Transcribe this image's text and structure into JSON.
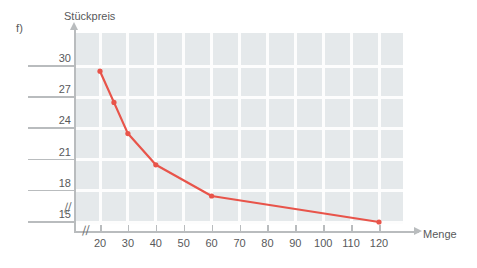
{
  "exercise": {
    "label": "f)"
  },
  "chart_data": {
    "type": "line",
    "title": "",
    "xlabel": "Menge",
    "ylabel": "Stückpreis",
    "xticks": [
      20,
      30,
      40,
      50,
      60,
      70,
      80,
      90,
      100,
      110,
      120
    ],
    "yticks": [
      30,
      27,
      24,
      21,
      18,
      15
    ],
    "xlim": [
      15,
      131
    ],
    "ylim": [
      13.5,
      31.5
    ],
    "grid": true,
    "legend": null,
    "axis_break_x": true,
    "axis_break_y": true,
    "break_symbol": "//",
    "series": [
      {
        "name": "Stückpreis",
        "color": "#e8544a",
        "x": [
          20,
          25,
          30,
          40,
          60,
          120
        ],
        "values": [
          29.5,
          26.5,
          23.5,
          20.5,
          17.5,
          15.0
        ]
      }
    ]
  },
  "colors": {
    "line": "#e8544a",
    "plot_background": "#e5e9eb",
    "gridline": "#fdfdfd",
    "axis": "#b9bcbe",
    "text": "#58595b"
  }
}
